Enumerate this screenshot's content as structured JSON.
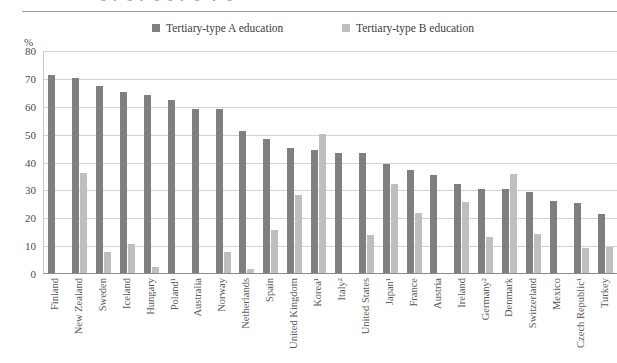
{
  "figure": {
    "clipped_caption_fragment": "g   y        g y   g  g        y gi        y gi",
    "y_axis_unit": "%",
    "legend": [
      {
        "label": "Tertiary-type A education",
        "color": "#7f7f7f",
        "name": "tertiary-type-a"
      },
      {
        "label": "Tertiary-type B education",
        "color": "#bfbfbf",
        "name": "tertiary-type-b"
      }
    ]
  },
  "chart_data": {
    "type": "bar",
    "title": "",
    "xlabel": "",
    "ylabel": "%",
    "ylim": [
      0,
      80
    ],
    "yticks": [
      0,
      10,
      20,
      30,
      40,
      50,
      60,
      70,
      80
    ],
    "grid": true,
    "legend_position": "top",
    "categories": [
      "Finland",
      "New Zealand",
      "Sweden",
      "Iceland",
      "Hungary",
      "Poland¹",
      "Australia",
      "Norway",
      "Netherlands",
      "Spain",
      "United Kingdom",
      "Korea¹",
      "Italy²",
      "United States",
      "Japan¹",
      "France",
      "Austria",
      "Ireland",
      "Germany²",
      "Denmark",
      "Switzerland",
      "Mexico",
      "Czech Republic¹",
      "Turkey"
    ],
    "series": [
      {
        "name": "Tertiary-type A education",
        "color": "#7f7f7f",
        "values": [
          71,
          70,
          67,
          65,
          64,
          62,
          59,
          59,
          51,
          48,
          45,
          44,
          43,
          43,
          39,
          37,
          35,
          32,
          30,
          30,
          29,
          26,
          25,
          21
        ]
      },
      {
        "name": "Tertiary-type B education",
        "color": "#bfbfbf",
        "values": [
          0,
          36,
          7.5,
          10.5,
          2,
          0,
          0,
          7.5,
          1.5,
          15.5,
          28,
          50,
          0,
          13.5,
          32,
          21.5,
          0,
          25.5,
          13,
          35.5,
          14,
          0,
          9,
          9.5
        ]
      }
    ],
    "footnote_markers": {
      "Poland¹": "1",
      "Korea¹": "1",
      "Italy²": "2",
      "Japan¹": "1",
      "Germany²": "2",
      "Czech Republic¹": "1"
    }
  }
}
